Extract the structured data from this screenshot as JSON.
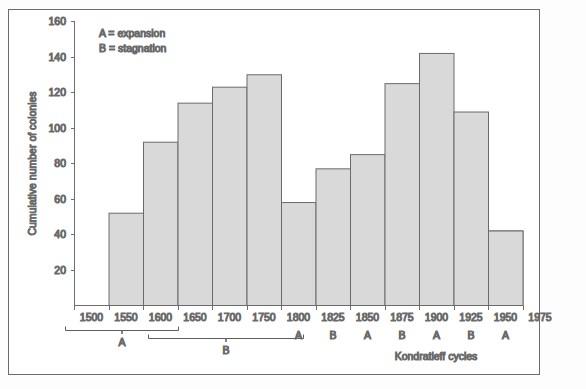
{
  "chart_data": {
    "type": "bar",
    "title": "",
    "xlabel": "Kondratieff cycles",
    "ylabel": "Cumulative number of colonies",
    "categories": [
      "1500",
      "1550",
      "1600",
      "1650",
      "1700",
      "1750",
      "1800",
      "1825",
      "1850",
      "1875",
      "1900",
      "1925",
      "1950"
    ],
    "values": [
      28,
      52,
      92,
      114,
      123,
      130,
      58,
      77,
      85,
      125,
      142,
      109,
      42
    ],
    "phase_labels": [
      "",
      "",
      "",
      "",
      "",
      "",
      "A",
      "B",
      "A",
      "B",
      "A",
      "B",
      "A"
    ],
    "xtick_labels": [
      "1500",
      "1550",
      "1600",
      "1650",
      "1700",
      "1750",
      "1800",
      "1825",
      "1850",
      "1875",
      "1900",
      "1925",
      "1950",
      "1975"
    ],
    "ytick_labels": [
      "20",
      "40",
      "60",
      "80",
      "100",
      "120",
      "140",
      "160"
    ],
    "ytick_values": [
      20,
      40,
      60,
      80,
      100,
      120,
      140,
      160
    ],
    "ylim": [
      0,
      160
    ],
    "grid": false,
    "legend_position": "top-left",
    "bar_color": "#d9d9d9",
    "bar_edge_color": "#6a6a6a",
    "axis_color": "#6e6e6e"
  },
  "legend": {
    "line1": "A = expansion",
    "line2": "B = stagnation"
  },
  "brackets": [
    {
      "label": "A",
      "from": "1500",
      "to": "1600"
    },
    {
      "label": "B",
      "from": "1600",
      "to": "1750"
    }
  ],
  "axes": {
    "y_title": "Cumulative number of colonies",
    "x_title": "Kondratieff cycles"
  }
}
